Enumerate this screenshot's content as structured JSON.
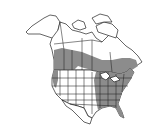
{
  "map": {
    "title": "Range map of North America",
    "region": "North America",
    "colors": {
      "background": "#ffffff",
      "land": "#ffffff",
      "range_fill": "#8c8c8c",
      "outline": "#222222"
    },
    "legend": [
      {
        "label": "Range",
        "color": "#8c8c8c"
      }
    ]
  }
}
